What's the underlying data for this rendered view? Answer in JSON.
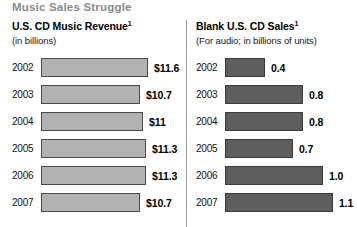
{
  "title": "Music Sales Struggle",
  "divider": {
    "name": "panel-divider"
  },
  "panels": [
    {
      "id": "cd-music-revenue",
      "title": "U.S. CD Music Revenue",
      "title_footnote": "1",
      "subtitle": "(in billions)",
      "bar_style": "light"
    },
    {
      "id": "blank-cd-sales",
      "title": "Blank U.S. CD Sales",
      "title_footnote": "1",
      "subtitle": "(For audio; in billions of units)",
      "bar_style": "dark"
    }
  ],
  "chart_data": [
    {
      "type": "bar",
      "id": "cd-music-revenue",
      "title": "U.S. CD Music Revenue",
      "subtitle": "(in billions)",
      "orientation": "horizontal",
      "xlabel": "",
      "ylabel": "",
      "grid": false,
      "legend": "none",
      "categories": [
        "2002",
        "2003",
        "2004",
        "2005",
        "2006",
        "2007"
      ],
      "values": [
        11.6,
        10.7,
        11.0,
        11.3,
        11.3,
        10.7
      ],
      "value_labels": [
        "$11.6",
        "$10.7",
        "$11",
        "$11.3",
        "$11.3",
        "$10.7"
      ],
      "bar_widths_px": [
        107,
        99,
        102,
        105,
        105,
        99
      ],
      "xlim": [
        0,
        12
      ],
      "color": "#b2b2b2"
    },
    {
      "type": "bar",
      "id": "blank-cd-sales",
      "title": "Blank U.S. CD Sales",
      "subtitle": "(For audio; in billions of units)",
      "orientation": "horizontal",
      "xlabel": "",
      "ylabel": "",
      "grid": false,
      "legend": "none",
      "categories": [
        "2002",
        "2003",
        "2004",
        "2005",
        "2006",
        "2007"
      ],
      "values": [
        0.4,
        0.8,
        0.8,
        0.7,
        1.0,
        1.1
      ],
      "value_labels": [
        "0.4",
        "0.8",
        "0.8",
        "0.7",
        "1.0",
        "1.1"
      ],
      "bar_widths_px": [
        40,
        78,
        78,
        68,
        98,
        108
      ],
      "xlim": [
        0,
        1.2
      ],
      "color": "#5e5e5e"
    }
  ],
  "colors": {
    "title_gray": "#8a8a8a",
    "bar_light": "#b2b2b2",
    "bar_dark": "#5e5e5e",
    "text": "#000000",
    "background": "#ffffff"
  }
}
